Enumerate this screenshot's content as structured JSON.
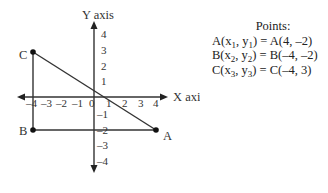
{
  "diagram": {
    "x_axis_label": "X axis",
    "y_axis_label": "Y axis",
    "x_ticks": [
      "–4",
      "–3",
      "–2",
      "–1",
      "0",
      "1",
      "2",
      "3",
      "4"
    ],
    "y_ticks_pos": [
      "4",
      "3",
      "2",
      "1"
    ],
    "y_ticks_neg": [
      "–1",
      "–2",
      "–3",
      "–4"
    ],
    "vertices": [
      {
        "label": "A",
        "x": 4,
        "y": -2
      },
      {
        "label": "B",
        "x": -4,
        "y": -2
      },
      {
        "label": "C",
        "x": -4,
        "y": 3
      }
    ],
    "line_color": "#333333"
  },
  "points_panel": {
    "title": "Points:",
    "rows": [
      {
        "lhs_name": "A",
        "lhs_x": "x",
        "lhs_xsub": "1",
        "lhs_y": "y",
        "lhs_ysub": "1",
        "rhs": "A(4, –2)"
      },
      {
        "lhs_name": "B",
        "lhs_x": "x",
        "lhs_xsub": "2",
        "lhs_y": "y",
        "lhs_ysub": "2",
        "rhs": "B(–4, –2)"
      },
      {
        "lhs_name": "C",
        "lhs_x": "x",
        "lhs_xsub": "3",
        "lhs_y": "y",
        "lhs_ysub": "3",
        "rhs": "C(–4, 3)"
      }
    ]
  }
}
